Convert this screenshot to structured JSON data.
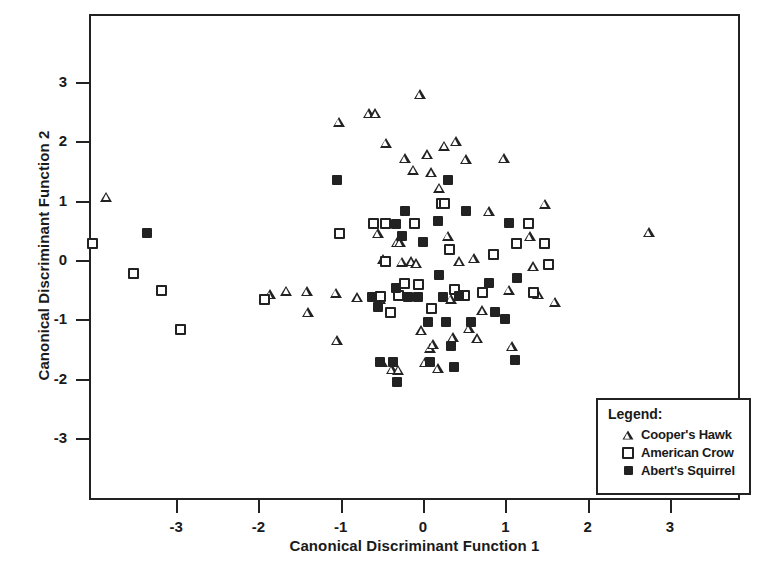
{
  "chart_data": {
    "type": "scatter",
    "title": "",
    "xlabel": "Canonical Discriminant Function 1",
    "ylabel": "Canonical Discriminant Function 2",
    "xlim": [
      -4.05,
      3.85
    ],
    "ylim": [
      -4.0,
      4.1
    ],
    "xticks": [
      -3,
      -2,
      -1,
      0,
      1,
      2,
      3
    ],
    "xtick_labels": [
      "-3",
      "-2",
      "-1",
      "0",
      "1",
      "2",
      "3"
    ],
    "yticks": [
      -3,
      -2,
      -1,
      0,
      1,
      2,
      3
    ],
    "ytick_labels": [
      "-3",
      "-2",
      "-1",
      "0",
      "1",
      "2",
      "3"
    ],
    "grid": false,
    "legend_position": "lower-right",
    "legend_title": "Legend:",
    "series": [
      {
        "name": "Cooper's Hawk",
        "marker": "open-triangle",
        "color": "#222222",
        "points": [
          [
            -3.85,
            1.07
          ],
          [
            -1.86,
            -0.58
          ],
          [
            -1.66,
            -0.52
          ],
          [
            -1.41,
            -0.53
          ],
          [
            -1.4,
            -0.88
          ],
          [
            -1.02,
            2.33
          ],
          [
            -1.06,
            -0.55
          ],
          [
            -1.05,
            -1.35
          ],
          [
            -0.8,
            -0.63
          ],
          [
            -0.66,
            2.48
          ],
          [
            -0.58,
            2.48
          ],
          [
            -0.57,
            -0.61
          ],
          [
            -0.55,
            0.45
          ],
          [
            -0.52,
            -0.66
          ],
          [
            -0.5,
            -1.72
          ],
          [
            -0.48,
            0.02
          ],
          [
            -0.45,
            1.98
          ],
          [
            -0.38,
            -1.84
          ],
          [
            -0.32,
            0.3
          ],
          [
            -0.3,
            -1.85
          ],
          [
            -0.28,
            0.3
          ],
          [
            -0.26,
            -0.03
          ],
          [
            -0.22,
            1.72
          ],
          [
            -0.14,
            -0.02
          ],
          [
            -0.12,
            1.52
          ],
          [
            -0.08,
            -0.05
          ],
          [
            -0.04,
            2.8
          ],
          [
            -0.02,
            -1.18
          ],
          [
            0.02,
            -1.72
          ],
          [
            0.05,
            1.78
          ],
          [
            0.08,
            -1.48
          ],
          [
            0.1,
            1.48
          ],
          [
            0.12,
            -1.42
          ],
          [
            0.18,
            -1.82
          ],
          [
            0.2,
            1.22
          ],
          [
            0.26,
            1.93
          ],
          [
            0.3,
            0.41
          ],
          [
            0.34,
            -0.65
          ],
          [
            0.36,
            -1.3
          ],
          [
            0.4,
            2.0
          ],
          [
            0.44,
            -0.02
          ],
          [
            0.52,
            1.7
          ],
          [
            0.56,
            -1.15
          ],
          [
            0.62,
            0.03
          ],
          [
            0.66,
            -1.32
          ],
          [
            0.72,
            -0.85
          ],
          [
            0.8,
            0.82
          ],
          [
            0.98,
            1.72
          ],
          [
            1.04,
            -0.5
          ],
          [
            1.08,
            -1.45
          ],
          [
            1.3,
            0.4
          ],
          [
            1.34,
            -0.1
          ],
          [
            1.4,
            -0.58
          ],
          [
            1.48,
            0.95
          ],
          [
            1.6,
            -0.7
          ],
          [
            2.74,
            0.47
          ]
        ]
      },
      {
        "name": "American Crow",
        "marker": "open-square",
        "color": "#222222",
        "points": [
          [
            -4.02,
            0.27
          ],
          [
            -3.52,
            -0.22
          ],
          [
            -3.18,
            -0.52
          ],
          [
            -2.95,
            -1.18
          ],
          [
            -1.92,
            -0.66
          ],
          [
            -1.02,
            0.45
          ],
          [
            -0.6,
            0.62
          ],
          [
            -0.52,
            -0.62
          ],
          [
            -0.46,
            0.62
          ],
          [
            -0.45,
            -0.02
          ],
          [
            -0.4,
            -0.88
          ],
          [
            -0.3,
            -0.6
          ],
          [
            -0.22,
            -0.4
          ],
          [
            -0.1,
            0.62
          ],
          [
            -0.05,
            -0.42
          ],
          [
            0.1,
            -0.82
          ],
          [
            0.22,
            0.95
          ],
          [
            0.26,
            0.95
          ],
          [
            0.32,
            0.18
          ],
          [
            0.38,
            -0.5
          ],
          [
            0.5,
            -0.6
          ],
          [
            0.72,
            -0.55
          ],
          [
            0.86,
            0.1
          ],
          [
            1.14,
            0.28
          ],
          [
            1.28,
            0.62
          ],
          [
            1.34,
            -0.55
          ],
          [
            1.48,
            0.28
          ],
          [
            1.52,
            -0.08
          ]
        ]
      },
      {
        "name": "Abert's Squirrel",
        "marker": "filled-square",
        "color": "#222222",
        "points": [
          [
            -3.35,
            0.45
          ],
          [
            -1.05,
            1.35
          ],
          [
            -0.62,
            -0.62
          ],
          [
            -0.55,
            -0.8
          ],
          [
            -0.52,
            -1.72
          ],
          [
            -0.36,
            -1.72
          ],
          [
            -0.33,
            0.6
          ],
          [
            -0.33,
            -0.48
          ],
          [
            -0.32,
            -2.05
          ],
          [
            -0.25,
            0.4
          ],
          [
            -0.22,
            0.82
          ],
          [
            -0.18,
            -0.62
          ],
          [
            -0.06,
            -0.62
          ],
          [
            0.0,
            0.3
          ],
          [
            0.06,
            -1.05
          ],
          [
            0.08,
            -1.72
          ],
          [
            0.18,
            0.65
          ],
          [
            0.2,
            -0.25
          ],
          [
            0.24,
            -0.62
          ],
          [
            0.28,
            -1.05
          ],
          [
            0.3,
            1.35
          ],
          [
            0.34,
            -1.45
          ],
          [
            0.38,
            -1.8
          ],
          [
            0.44,
            -0.6
          ],
          [
            0.52,
            0.82
          ],
          [
            0.58,
            -1.05
          ],
          [
            0.8,
            -0.38
          ],
          [
            0.88,
            -0.88
          ],
          [
            1.0,
            -1.0
          ],
          [
            1.04,
            0.62
          ],
          [
            1.12,
            -1.68
          ],
          [
            1.14,
            -0.3
          ]
        ]
      }
    ]
  }
}
